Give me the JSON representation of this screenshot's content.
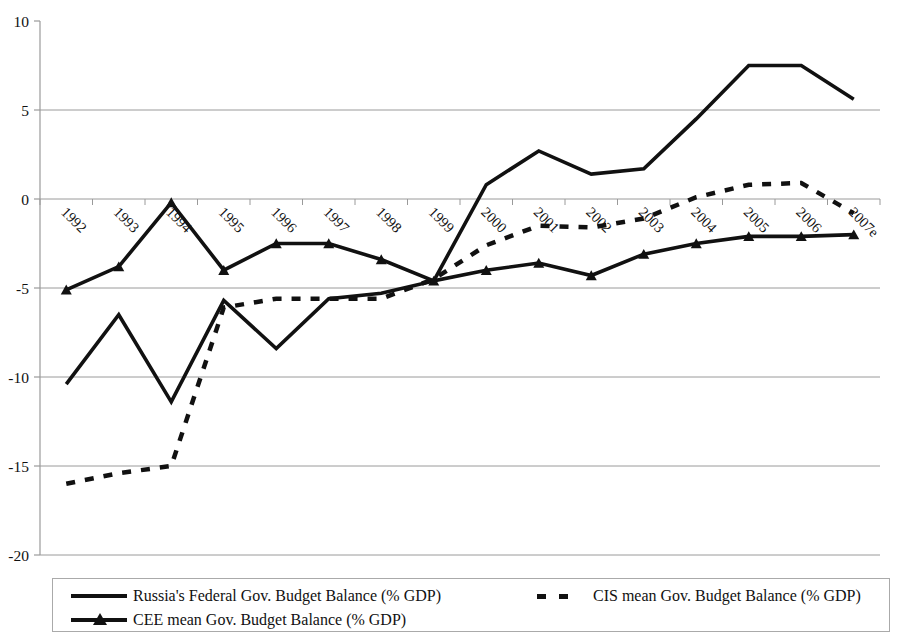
{
  "chart_data": {
    "type": "line",
    "title": "",
    "subtitle": "",
    "xlabel": "",
    "ylabel": "",
    "ylim": [
      -20,
      10
    ],
    "ytick_values": [
      10,
      5,
      0,
      -5,
      -10,
      -15,
      -20
    ],
    "ytick_labels": [
      "10",
      "5",
      "0",
      "-5",
      "-10",
      "-15",
      "-20"
    ],
    "grid": true,
    "grid_axis": "y",
    "legend_position": "bottom",
    "categories": [
      "1992",
      "1993",
      "1994",
      "1995",
      "1996",
      "1997",
      "1998",
      "1999",
      "2000",
      "2001",
      "2002",
      "2003",
      "2004",
      "2005",
      "2006",
      "2007e"
    ],
    "series": [
      {
        "name": "Russia's Federal Gov. Budget Balance (% GDP)",
        "style": "solid",
        "marker": "none",
        "color": "#111111",
        "values": [
          -10.4,
          -6.5,
          -11.4,
          -5.7,
          -8.4,
          -5.6,
          -5.3,
          -4.6,
          0.8,
          2.7,
          1.4,
          1.7,
          4.5,
          7.5,
          7.5,
          5.6
        ]
      },
      {
        "name": "CIS mean Gov. Budget Balance (% GDP)",
        "style": "dashed",
        "marker": "none",
        "color": "#111111",
        "values": [
          -16.0,
          -15.4,
          -15.0,
          -6.1,
          -5.6,
          -5.6,
          -5.6,
          -4.5,
          -2.6,
          -1.5,
          -1.6,
          -1.1,
          0.1,
          0.8,
          0.9,
          -0.8
        ]
      },
      {
        "name": "CEE mean Gov. Budget Balance (% GDP)",
        "style": "solid",
        "marker": "triangle",
        "color": "#111111",
        "values": [
          -5.1,
          -3.8,
          -0.2,
          -4.0,
          -2.5,
          -2.5,
          -3.4,
          -4.6,
          -4.0,
          -3.6,
          -4.3,
          -3.1,
          -2.5,
          -2.1,
          -2.1,
          -2.0
        ]
      }
    ]
  },
  "legend": {
    "items": [
      {
        "label": "Russia's Federal Gov. Budget Balance (% GDP)",
        "style": "solid"
      },
      {
        "label": "CIS mean Gov. Budget Balance (% GDP)",
        "style": "dashed"
      },
      {
        "label": "CEE mean Gov. Budget Balance (% GDP)",
        "style": "solid-triangle"
      }
    ]
  }
}
